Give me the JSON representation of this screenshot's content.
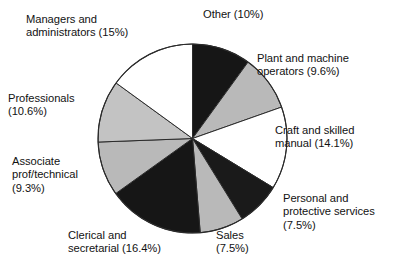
{
  "figure": {
    "title": "",
    "background_color": "#ffffff",
    "text_color": "#121212"
  },
  "chart_data": {
    "type": "pie",
    "title": "",
    "xlabel": "",
    "ylabel": "",
    "legend_position": "none",
    "grid": false,
    "labels_outside": true,
    "start_angle_deg": 0,
    "direction": "clockwise",
    "categories": [
      "Other",
      "Plant and machine operators",
      "Craft and skilled manual",
      "Personal and protective services",
      "Sales",
      "Clerical and secretarial",
      "Associate prof/technical",
      "Professionals",
      "Managers and administrators"
    ],
    "values": [
      10,
      9.6,
      14.1,
      7.5,
      7.5,
      16.4,
      9.3,
      10.6,
      15
    ],
    "value_unit": "%",
    "slice_colors": [
      "#161616",
      "#b9b9b9",
      "#ffffff",
      "#1a1a1a",
      "#b9b9b9",
      "#161616",
      "#b9b9b9",
      "#c3c3c3",
      "#ffffff"
    ],
    "slice_edge_color": "#2b2b2b",
    "annotations": [
      {
        "key": "other",
        "text": "Other (10%)"
      },
      {
        "key": "plant",
        "text": "Plant and machine\noperators (9.6%)"
      },
      {
        "key": "craft",
        "text": "Craft and skilled\nmanual (14.1%)"
      },
      {
        "key": "personal",
        "text": "Personal and\nprotective services\n(7.5%)"
      },
      {
        "key": "sales",
        "text": "Sales\n(7.5%)"
      },
      {
        "key": "clerical",
        "text": "Clerical and\nsecretarial (16.4%)"
      },
      {
        "key": "associate",
        "text": "Associate\nprof/technical\n(9.3%)"
      },
      {
        "key": "professionals",
        "text": "Professionals\n(10.6%)"
      },
      {
        "key": "managers",
        "text": "Managers and\nadministrators (15%)"
      }
    ]
  },
  "labels": {
    "other": "Other (10%)",
    "plant": "Plant and machine\noperators (9.6%)",
    "craft": "Craft and skilled\nmanual (14.1%)",
    "personal": "Personal and\nprotective services\n(7.5%)",
    "sales": "Sales\n(7.5%)",
    "clerical": "Clerical and\nsecretarial (16.4%)",
    "associate": "Associate\nprof/technical\n(9.3%)",
    "professionals": "Professionals\n(10.6%)",
    "managers": "Managers and\nadministrators (15%)"
  }
}
